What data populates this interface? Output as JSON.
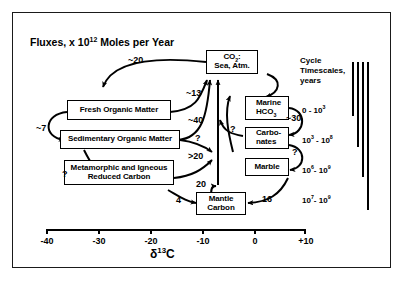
{
  "figure": {
    "title": "Fluxes, x 10",
    "title_exponent": "12",
    "title_tail": " Moles per Year"
  },
  "boxes": [
    {
      "id": "co2",
      "label_line1": "CO",
      "label_sub": "2",
      "label_line1_tail": ":",
      "label_line2": "Sea, Atm."
    },
    {
      "id": "fresh-organic-matter",
      "label": "Fresh  Organic Matter"
    },
    {
      "id": "sedimentary-organic-matter",
      "label": "Sedimentary Organic Matter"
    },
    {
      "id": "metamorphic-igneous-reduced-carbon",
      "label_line1": "Metamorphic and Igneous",
      "label_line2": "Reduced Carbon"
    },
    {
      "id": "marine-hco3",
      "label_line1": "Marine",
      "label_line2": "HCO",
      "label_sub": "3"
    },
    {
      "id": "carbonates",
      "label_line1": "Carbo-",
      "label_line2": "nates"
    },
    {
      "id": "marble",
      "label": "Marble"
    },
    {
      "id": "mantle-carbon",
      "label_line1": "Mantle",
      "label_line2": "Carbon"
    }
  ],
  "flux_labels": {
    "fresh_to_co2": "~20",
    "fresh_to_co2_right": "~13",
    "co2_to_sedimentary_loop": "~7",
    "sed_to_co2": "~40",
    "sed_unknown": "?",
    "metamorphic_unknown": "?",
    "metamorphic_to_co2": ">20",
    "marine_to_co2_unknown": "?",
    "marine_carbonate": "~30",
    "carbonate_marble_unknown": "?",
    "mantle_in_20": "20",
    "mantle_in_4": "4",
    "marble_to_mantle_16": "16"
  },
  "timescales": {
    "heading_line1": "Cycle",
    "heading_line2": "Timescales,",
    "heading_line3": "years",
    "rows": [
      {
        "base1": "0 - 10",
        "exp1": "3"
      },
      {
        "base0": "10",
        "exp0": "3",
        "sep": " - ",
        "base1": "10",
        "exp1": "8"
      },
      {
        "base0": "10",
        "exp0": "6",
        "sep": "- ",
        "base1": "10",
        "exp1": "9"
      },
      {
        "base0": "10",
        "exp0": "7",
        "sep": "- ",
        "base1": "10",
        "exp1": "9"
      }
    ]
  },
  "axis": {
    "title_delta": "δ",
    "title_exp": "13",
    "title_tail": "C",
    "ticks": [
      "-40",
      "-30",
      "-20",
      "-10",
      "0",
      "+10"
    ],
    "min": -40,
    "max": 10
  },
  "colors": {
    "ink": "#000000",
    "background": "#ffffff"
  }
}
